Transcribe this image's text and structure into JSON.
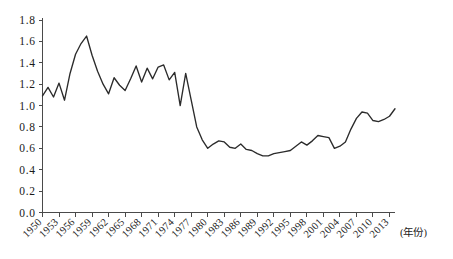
{
  "chart_data": {
    "type": "line",
    "title": "",
    "subtitle": "",
    "xlabel": "(年份)",
    "ylabel": "",
    "xlim": [
      1950,
      2014
    ],
    "ylim": [
      0.0,
      1.8
    ],
    "grid": false,
    "legend": null,
    "y_ticks": [
      "1.8",
      "1.6",
      "1.4",
      "1.2",
      "1.0",
      "0.8",
      "0.6",
      "0.4",
      "0.2",
      "0.0"
    ],
    "y_tick_values": [
      1.8,
      1.6,
      1.4,
      1.2,
      1.0,
      0.8,
      0.6,
      0.4,
      0.2,
      0.0
    ],
    "x_ticks": [
      "1950",
      "1953",
      "1956",
      "1959",
      "1962",
      "1965",
      "1968",
      "1971",
      "1974",
      "1977",
      "1980",
      "1983",
      "1986",
      "1989",
      "1992",
      "1995",
      "1998",
      "2001",
      "2004",
      "2007",
      "2010",
      "2013"
    ],
    "x_tick_values": [
      1950,
      1953,
      1956,
      1959,
      1962,
      1965,
      1968,
      1971,
      1974,
      1977,
      1980,
      1983,
      1986,
      1989,
      1992,
      1995,
      1998,
      2001,
      2004,
      2007,
      2010,
      2013
    ],
    "x": [
      1950,
      1951,
      1952,
      1953,
      1954,
      1955,
      1956,
      1957,
      1958,
      1959,
      1960,
      1961,
      1962,
      1963,
      1964,
      1965,
      1966,
      1967,
      1968,
      1969,
      1970,
      1971,
      1972,
      1973,
      1974,
      1975,
      1976,
      1977,
      1978,
      1979,
      1980,
      1981,
      1982,
      1983,
      1984,
      1985,
      1986,
      1987,
      1988,
      1989,
      1990,
      1991,
      1992,
      1993,
      1994,
      1995,
      1996,
      1997,
      1998,
      1999,
      2000,
      2001,
      2002,
      2003,
      2004,
      2005,
      2006,
      2007,
      2008,
      2009,
      2010,
      2011,
      2012,
      2013,
      2014
    ],
    "values": [
      1.09,
      1.17,
      1.08,
      1.21,
      1.05,
      1.3,
      1.48,
      1.58,
      1.65,
      1.47,
      1.32,
      1.2,
      1.11,
      1.26,
      1.19,
      1.14,
      1.25,
      1.37,
      1.22,
      1.35,
      1.25,
      1.36,
      1.38,
      1.24,
      1.31,
      1.0,
      1.3,
      1.05,
      0.8,
      0.68,
      0.6,
      0.64,
      0.67,
      0.66,
      0.61,
      0.6,
      0.64,
      0.59,
      0.58,
      0.55,
      0.53,
      0.53,
      0.55,
      0.56,
      0.57,
      0.58,
      0.62,
      0.66,
      0.63,
      0.67,
      0.72,
      0.71,
      0.7,
      0.6,
      0.62,
      0.66,
      0.78,
      0.88,
      0.94,
      0.93,
      0.86,
      0.85,
      0.87,
      0.9,
      0.97
    ],
    "series": [
      {
        "name": "series-1",
        "color": "#2b2b2b",
        "values": [
          1.09,
          1.17,
          1.08,
          1.21,
          1.05,
          1.3,
          1.48,
          1.58,
          1.65,
          1.47,
          1.32,
          1.2,
          1.11,
          1.26,
          1.19,
          1.14,
          1.25,
          1.37,
          1.22,
          1.35,
          1.25,
          1.36,
          1.38,
          1.24,
          1.31,
          1.0,
          1.3,
          1.05,
          0.8,
          0.68,
          0.6,
          0.64,
          0.67,
          0.66,
          0.61,
          0.6,
          0.64,
          0.59,
          0.58,
          0.55,
          0.53,
          0.53,
          0.55,
          0.56,
          0.57,
          0.58,
          0.62,
          0.66,
          0.63,
          0.67,
          0.72,
          0.71,
          0.7,
          0.6,
          0.62,
          0.66,
          0.78,
          0.88,
          0.94,
          0.93,
          0.86,
          0.85,
          0.87,
          0.9,
          0.97
        ]
      }
    ]
  },
  "axes": {
    "y_axis_name": "y-axis",
    "x_axis_name": "x-axis",
    "x_unit_label": "(年份)"
  },
  "colors": {
    "line": "#2b2b2b",
    "axis": "#4a4a4a",
    "text": "#1a1a1a",
    "background": "#ffffff"
  }
}
